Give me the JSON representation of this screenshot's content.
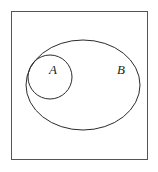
{
  "figure": {
    "name": "subset-venn-diagram",
    "background_color": "#ffffff"
  },
  "chart_data": {
    "type": "diagram",
    "title": "",
    "subtitle": "",
    "xlabel": "",
    "ylabel": "",
    "diagram_kind": "euler-venn-subset",
    "relation": "A subset of B",
    "grid": false,
    "legend_position": "none",
    "shapes": [
      {
        "id": "universe",
        "kind": "rectangle",
        "label": "",
        "x": 11,
        "y": 11,
        "width": 137,
        "height": 149,
        "stroke": "#555555",
        "stroke_width": 1,
        "fill": "none"
      },
      {
        "id": "set-b",
        "kind": "ellipse",
        "label": "B",
        "cx": 83,
        "cy": 85,
        "rx": 57,
        "ry": 45,
        "stroke": "#2b2b2b",
        "stroke_width": 1,
        "fill": "none"
      },
      {
        "id": "set-a",
        "kind": "circle",
        "label": "A",
        "cx": 50,
        "cy": 77,
        "r": 22,
        "stroke": "#2b2b2b",
        "stroke_width": 1,
        "fill": "none"
      }
    ],
    "labels": [
      {
        "id": "label-a",
        "text": "A",
        "x": 53,
        "y": 74,
        "style": "italic-serif"
      },
      {
        "id": "label-b",
        "text": "B",
        "x": 121,
        "y": 74,
        "style": "italic-serif"
      }
    ]
  },
  "labels": {
    "set_a": "A",
    "set_b": "B"
  },
  "colors": {
    "frame_stroke": "#555555",
    "curve_stroke": "#2b2b2b",
    "label_text": "#1b1b1b",
    "background": "#ffffff"
  }
}
